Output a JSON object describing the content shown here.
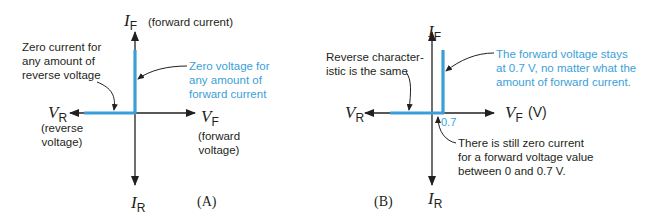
{
  "colors": {
    "characteristic": "#3a9fd8",
    "axis": "#231f20",
    "annotation_blue": "#3a9fd8"
  },
  "panel_a": {
    "label": "(A)",
    "axes": {
      "if_symbol": "I",
      "if_sub": "F",
      "if_desc": "(forward current)",
      "ir_symbol": "I",
      "ir_sub": "R",
      "vr_symbol": "V",
      "vr_sub": "R",
      "vr_desc_1": "(reverse",
      "vr_desc_2": "voltage)",
      "vf_symbol": "V",
      "vf_sub": "F",
      "vf_desc_1": "(forward",
      "vf_desc_2": "voltage)"
    },
    "annotations": {
      "reverse": [
        "Zero current for",
        "any amount of",
        "reverse voltage"
      ],
      "forward": [
        "Zero voltage for",
        "any amount of",
        "forward current"
      ]
    }
  },
  "panel_b": {
    "label": "(B)",
    "axes": {
      "if_symbol": "I",
      "if_sub": "F",
      "ir_symbol": "I",
      "ir_sub": "R",
      "vr_symbol": "V",
      "vr_sub": "R",
      "vf_symbol": "V",
      "vf_sub": "F",
      "vf_unit": "(V)"
    },
    "tick_label": "0.7",
    "annotations": {
      "reverse": [
        "Reverse character-",
        "istic is the same"
      ],
      "forward": [
        "The forward voltage stays",
        "at 0.7 V, no matter what the",
        "amount of forward current."
      ],
      "zero_current": [
        "There is still zero current",
        "for a forward  voltage value",
        "between 0 and 0.7 V."
      ]
    }
  }
}
